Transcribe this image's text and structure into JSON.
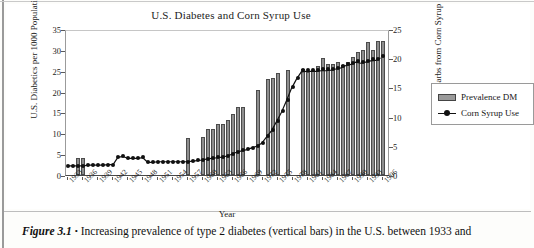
{
  "figure": {
    "caption_label": "Figure 3.1",
    "caption_bullet": "•",
    "caption_text": "Increasing prevalence of type 2 diabetes (vertical bars) in the U.S. between 1933 and"
  },
  "legend": {
    "position": "right",
    "items": [
      {
        "label": "Prevalence DM",
        "kind": "bar",
        "color": "#9a9a9a"
      },
      {
        "label": "Corn Syrup Use",
        "kind": "line-marker",
        "color": "#111111"
      }
    ]
  },
  "chart_data": {
    "type": "bar",
    "title": "U.S. Diabetes and Corn Syrup Use",
    "xlabel": "Year",
    "ylabel": "U.S. Diabetics per 1000 Population",
    "y2label": "% of Carbs from Corn Syrup",
    "ylim": [
      0,
      35
    ],
    "y2lim": [
      0,
      25
    ],
    "yticks": [
      0,
      5,
      10,
      15,
      20,
      25,
      30,
      35
    ],
    "y2ticks": [
      0,
      5,
      10,
      15,
      20,
      25
    ],
    "grid": false,
    "x": [
      1933,
      1934,
      1935,
      1936,
      1937,
      1938,
      1939,
      1940,
      1941,
      1942,
      1943,
      1944,
      1945,
      1946,
      1947,
      1948,
      1949,
      1950,
      1951,
      1952,
      1953,
      1954,
      1955,
      1956,
      1957,
      1958,
      1959,
      1960,
      1961,
      1962,
      1963,
      1964,
      1965,
      1966,
      1967,
      1968,
      1969,
      1970,
      1971,
      1972,
      1973,
      1974,
      1975,
      1976,
      1977,
      1978,
      1979,
      1980,
      1981,
      1982,
      1983,
      1984,
      1985,
      1986,
      1987,
      1988,
      1989,
      1990,
      1991,
      1992,
      1993,
      1994,
      1995,
      1996,
      1997
    ],
    "xtick_labels": [
      "1933",
      "1936",
      "1939",
      "1942",
      "1945",
      "1948",
      "1951",
      "1954",
      "1957",
      "1960",
      "1963",
      "1966",
      "1969",
      "1972",
      "1975",
      "1978",
      "1981",
      "1984",
      "1987",
      "1990",
      "1993",
      "1996"
    ],
    "series": [
      {
        "name": "Prevalence DM",
        "axis": "left",
        "unit": "diabetics per 1000 population",
        "values": [
          null,
          null,
          4.0,
          4.0,
          null,
          null,
          null,
          null,
          null,
          null,
          null,
          null,
          null,
          null,
          null,
          null,
          null,
          null,
          null,
          null,
          null,
          null,
          null,
          null,
          8.8,
          null,
          null,
          9.2,
          11.0,
          11.1,
          12.2,
          12.3,
          13.2,
          14.7,
          16.2,
          16.2,
          null,
          null,
          20.5,
          null,
          23.0,
          23.2,
          24.5,
          null,
          25.1,
          null,
          null,
          25.5,
          24.8,
          25.1,
          26.1,
          28.0,
          26.5,
          26.6,
          27.0,
          26.3,
          27.1,
          28.4,
          29.5,
          29.9,
          31.8,
          30.0,
          32.1,
          32.1,
          null
        ]
      },
      {
        "name": "Corn Syrup Use",
        "axis": "right",
        "unit": "% of carbohydrates from corn syrup",
        "values": [
          1.6,
          1.6,
          1.6,
          1.6,
          1.7,
          1.7,
          1.7,
          1.7,
          1.8,
          1.8,
          3.1,
          3.2,
          2.9,
          2.9,
          2.9,
          3.0,
          2.2,
          2.2,
          2.3,
          2.3,
          2.3,
          2.3,
          2.3,
          2.3,
          2.3,
          2.4,
          2.5,
          2.6,
          2.8,
          2.9,
          3.0,
          3.1,
          3.3,
          3.6,
          4.0,
          4.2,
          4.4,
          4.7,
          5.0,
          5.5,
          6.6,
          7.7,
          9.3,
          10.9,
          12.9,
          15.0,
          16.6,
          17.9,
          18.0,
          18.0,
          18.0,
          18.1,
          18.1,
          18.2,
          18.4,
          18.6,
          19.0,
          19.2,
          19.6,
          19.4,
          19.6,
          19.8,
          19.9,
          20.3,
          null
        ]
      }
    ]
  }
}
